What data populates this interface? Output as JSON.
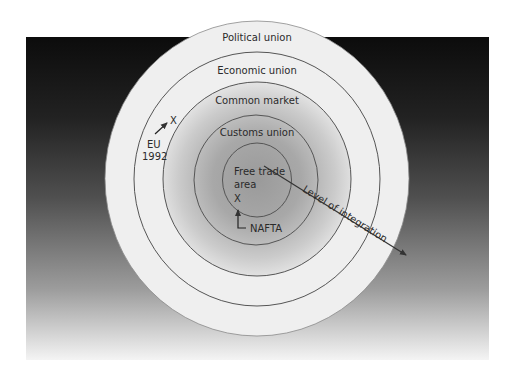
{
  "diagram": {
    "type": "concentric-circles",
    "colors": {
      "background_top": "#0e0e0e",
      "background_mid": "#4d4d4d",
      "background_bottom": "#f2f2f2",
      "outer_rings": "#f0f0f0",
      "inner_center": "#9a9a9a",
      "inner_edge": "#e2e2e2",
      "stroke": "#555555",
      "arrow": "#333333"
    },
    "rings": [
      {
        "id": "political-union",
        "label": "Political union"
      },
      {
        "id": "economic-union",
        "label": "Economic union"
      },
      {
        "id": "common-market",
        "label": "Common market"
      },
      {
        "id": "customs-union",
        "label": "Customs union"
      },
      {
        "id": "free-trade-area",
        "label_line1": "Free trade",
        "label_line2": "area"
      }
    ],
    "markers": {
      "eu": {
        "marker": "X",
        "label_line1": "EU",
        "label_line2": "1992"
      },
      "nafta": {
        "marker": "X",
        "label": "NAFTA"
      }
    },
    "axis": {
      "label": "Level of integration"
    }
  }
}
